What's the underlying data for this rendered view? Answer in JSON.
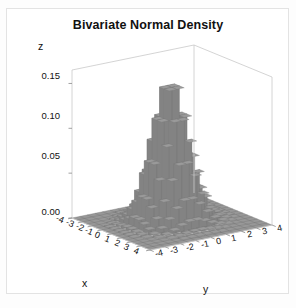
{
  "chart_data": {
    "type": "bar",
    "title": "Bivariate Normal Density",
    "subtype": "3d-histogram-blocks",
    "xlabel": "x",
    "ylabel": "y",
    "zlabel": "z",
    "xlim": [
      -4,
      4
    ],
    "ylim": [
      -4,
      4
    ],
    "zlim": [
      0.0,
      0.165
    ],
    "grid": true,
    "legend": false,
    "x_ticks": [
      "-4",
      "-3",
      "-2",
      "-1",
      "0",
      "1",
      "2",
      "3",
      "4"
    ],
    "y_ticks": [
      "-4",
      "-3",
      "-2",
      "-1",
      "0",
      "1",
      "2",
      "3",
      "4"
    ],
    "z_ticks": [
      "0.00",
      "0.05",
      "0.10",
      "0.15"
    ],
    "z_tick_values": [
      0.0,
      0.05,
      0.1,
      0.15
    ],
    "x_values": [
      -4,
      -3.5,
      -3,
      -2.5,
      -2,
      -1.5,
      -1,
      -0.5,
      0,
      0.5,
      1,
      1.5,
      2,
      2.5,
      3,
      3.5,
      4
    ],
    "y_values": [
      -4,
      -3.5,
      -3,
      -2.5,
      -2,
      -1.5,
      -1,
      -0.5,
      0,
      0.5,
      1,
      1.5,
      2,
      2.5,
      3,
      3.5,
      4
    ],
    "peak_value": 0.159,
    "peak_at": [
      0,
      0
    ],
    "colors": {
      "bar_top": "#9a9a9a",
      "bar_left": "#b4b4b4",
      "bar_right": "#838383",
      "base_plane": "#8f8f8f",
      "frame": "#c9c9c9",
      "text": "#111111"
    }
  },
  "axes": {
    "z_title": "z",
    "x_title": "x",
    "y_title": "y"
  }
}
